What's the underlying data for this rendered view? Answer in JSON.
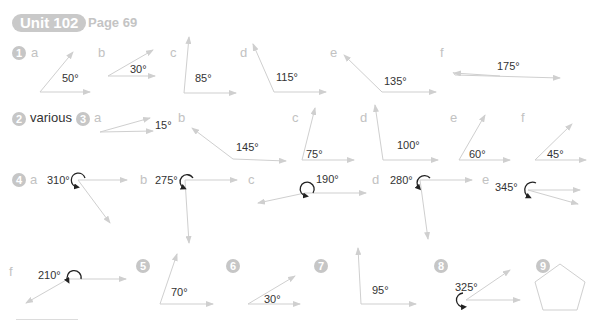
{
  "header": {
    "unit": "Unit 102",
    "page": "Page 69"
  },
  "colors": {
    "line": "#cfcfcf",
    "arc": "#222222",
    "badge": "#c6c6c6",
    "letter": "#c2c2c2"
  },
  "q1": {
    "num": "1",
    "items": [
      {
        "letter": "a",
        "angle": "50°"
      },
      {
        "letter": "b",
        "angle": "30°"
      },
      {
        "letter": "c",
        "angle": "85°"
      },
      {
        "letter": "d",
        "angle": "115°"
      },
      {
        "letter": "e",
        "angle": "135°"
      },
      {
        "letter": "f",
        "angle": "175°"
      }
    ]
  },
  "q2": {
    "num": "2",
    "answer": "various"
  },
  "q3": {
    "num": "3",
    "items": [
      {
        "letter": "a",
        "angle": "15°"
      },
      {
        "letter": "b",
        "angle": "145°"
      },
      {
        "letter": "c",
        "angle": "75°"
      },
      {
        "letter": "d",
        "angle": "100°"
      },
      {
        "letter": "e",
        "angle": "60°"
      },
      {
        "letter": "f",
        "angle": "45°"
      }
    ]
  },
  "q4": {
    "num": "4",
    "items": [
      {
        "letter": "a",
        "angle": "310°"
      },
      {
        "letter": "b",
        "angle": "275°"
      },
      {
        "letter": "c",
        "angle": "190°"
      },
      {
        "letter": "d",
        "angle": "280°"
      },
      {
        "letter": "e",
        "angle": "345°"
      },
      {
        "letter": "f",
        "angle": "210°"
      }
    ]
  },
  "q5": {
    "num": "5",
    "angle": "70°"
  },
  "q6": {
    "num": "6",
    "angle": "30°"
  },
  "q7": {
    "num": "7",
    "angle": "95°"
  },
  "q8": {
    "num": "8",
    "angle": "325°"
  },
  "q9": {
    "num": "9",
    "shape": "pentagon"
  }
}
